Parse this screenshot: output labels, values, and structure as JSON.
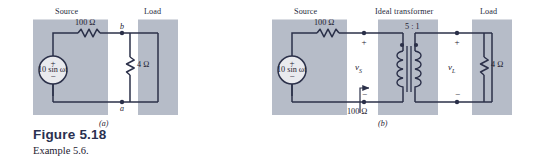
{
  "figure": {
    "title": "Figure 5.18",
    "caption": "Example 5.6.",
    "sublabel_a": "(a)",
    "sublabel_b": "(b)"
  },
  "colors": {
    "panel_fill": "#b6bcc8",
    "wire": "#2b3049",
    "text": "#1d2030",
    "title": "#2a3050",
    "background": "#ffffff"
  },
  "circuit_a": {
    "panels": [
      {
        "name": "source",
        "label": "Source"
      },
      {
        "name": "load",
        "label": "Load"
      }
    ],
    "source_label": "10 sin ωt",
    "series_resistor": "100 Ω",
    "load_resistor": "4 Ω",
    "node_top": "b",
    "node_bottom": "a",
    "source_plus": "+",
    "source_minus": "−"
  },
  "circuit_b": {
    "panels": [
      {
        "name": "source",
        "label": "Source"
      },
      {
        "name": "ideal-transformer",
        "label": "Ideal transformer"
      },
      {
        "name": "load",
        "label": "Load"
      }
    ],
    "source_label": "10 sin ωt",
    "series_resistor": "100 Ω",
    "reflected_resistor": "100 Ω",
    "load_resistor": "4 Ω",
    "turns_ratio": "5 : 1",
    "source_voltage": "v",
    "source_voltage_sub": "S",
    "load_voltage": "v",
    "load_voltage_sub": "L",
    "source_plus": "+",
    "source_minus": "−",
    "vs_plus": "+",
    "vs_minus": "−",
    "vl_plus": "+",
    "vl_minus": "−"
  }
}
